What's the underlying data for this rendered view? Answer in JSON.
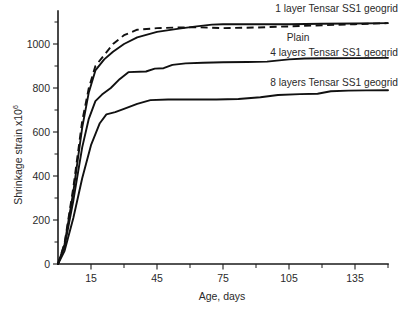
{
  "chart_data": {
    "type": "line",
    "title": "",
    "xlabel": "Age, days",
    "ylabel": "Shrinkage strain ×10⁶",
    "ylabel_base": "Shrinkage strain x10",
    "ylabel_exponent": "6",
    "xlim": [
      0,
      150
    ],
    "ylim": [
      0,
      1150
    ],
    "grid": false,
    "legend_position": "inline-annotations",
    "x_ticks_major": [
      15,
      45,
      75,
      105,
      135
    ],
    "x_ticks_minor": [
      30,
      60,
      90,
      120,
      150
    ],
    "x_tick_labels": [
      "15",
      "45",
      "75",
      "105",
      "135"
    ],
    "y_ticks_major": [
      0,
      200,
      400,
      600,
      800,
      1000
    ],
    "y_ticks_minor": [
      100,
      300,
      500,
      700,
      900,
      1100
    ],
    "y_tick_labels": [
      "0",
      "200",
      "400",
      "600",
      "800",
      "1000"
    ],
    "series": [
      {
        "name": "1 layer Tensar SS1 geogrid",
        "style": "solid",
        "label_anchor": "end",
        "x": [
          0,
          3,
          7,
          11,
          14,
          17,
          21,
          25,
          30,
          36,
          45,
          55,
          63,
          70,
          75,
          90,
          105,
          120,
          135,
          150
        ],
        "values": [
          0,
          90,
          330,
          620,
          780,
          880,
          930,
          965,
          1000,
          1030,
          1055,
          1070,
          1080,
          1088,
          1090,
          1090,
          1090,
          1092,
          1093,
          1095
        ]
      },
      {
        "name": "Plain",
        "style": "dashed",
        "label_anchor": "middle",
        "x": [
          0,
          3,
          7,
          11,
          14,
          17,
          21,
          25,
          30,
          36,
          45,
          55,
          63,
          70,
          75,
          90,
          105,
          120,
          135,
          150
        ],
        "values": [
          0,
          95,
          350,
          650,
          800,
          900,
          950,
          1000,
          1040,
          1065,
          1072,
          1075,
          1076,
          1074,
          1072,
          1075,
          1080,
          1085,
          1090,
          1095
        ]
      },
      {
        "name": "4 layers Tensar SS1 geogrid",
        "style": "solid",
        "label_anchor": "end",
        "x": [
          0,
          3,
          7,
          11,
          14,
          17,
          20,
          24,
          28,
          32,
          40,
          44,
          48,
          52,
          58,
          66,
          75,
          86,
          95,
          105,
          112,
          120,
          135,
          150
        ],
        "values": [
          0,
          80,
          290,
          530,
          660,
          740,
          770,
          800,
          840,
          872,
          875,
          888,
          890,
          905,
          912,
          915,
          917,
          918,
          920,
          930,
          934,
          935,
          936,
          937
        ]
      },
      {
        "name": "8 layers Tensar SS1 geogrid",
        "style": "solid",
        "label_anchor": "end",
        "x": [
          0,
          3,
          7,
          11,
          15,
          19,
          22,
          26,
          30,
          36,
          42,
          50,
          60,
          72,
          82,
          92,
          100,
          110,
          118,
          124,
          132,
          140,
          150
        ],
        "values": [
          0,
          60,
          210,
          390,
          540,
          640,
          680,
          690,
          705,
          728,
          745,
          748,
          748,
          748,
          750,
          758,
          768,
          772,
          774,
          785,
          788,
          789,
          790
        ]
      }
    ],
    "annotations": [
      {
        "text": "1 layer Tensar SS1 geogrid",
        "series": "1 layer Tensar SS1 geogrid"
      },
      {
        "text": "Plain",
        "series": "Plain"
      },
      {
        "text": "4 layers Tensar SS1 geogrid",
        "series": "4 layers Tensar SS1 geogrid"
      },
      {
        "text": "8 layers Tensar SS1 geogrid",
        "series": "8 layers Tensar SS1 geogrid"
      }
    ],
    "colors": {
      "line": "#111111",
      "axis": "#1a1a1a",
      "text": "#2a2a2a",
      "background": "#ffffff"
    }
  }
}
